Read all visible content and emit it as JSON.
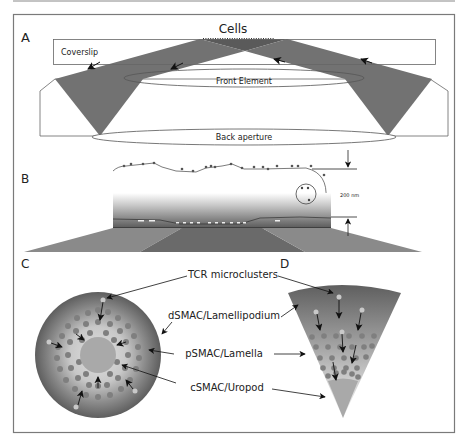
{
  "panels": {
    "a": {
      "letter": "A",
      "cells_label": "Cells",
      "coverslip_label": "Coverslip",
      "front_element_label": "Front Element",
      "back_aperture_label": "Back aperture"
    },
    "b": {
      "letter": "B",
      "distance_label": "200 nm"
    },
    "c": {
      "letter": "C"
    },
    "d": {
      "letter": "D"
    }
  },
  "annotations": {
    "tcr": "TCR microclusters",
    "dsmac": "dSMAC/Lamellipodium",
    "psmac": "pSMAC/Lamella",
    "csmac": "cSMAC/Uropod"
  },
  "colors": {
    "beam": "#6e6e6e",
    "frame": "#7a7a7a",
    "outer_ring": "#5f5f5f",
    "inner_light": "#d2d2d2",
    "cluster": "#7f7f7f",
    "cluster_light": "#c9c9c9",
    "csmac": "#a9a9a9"
  }
}
